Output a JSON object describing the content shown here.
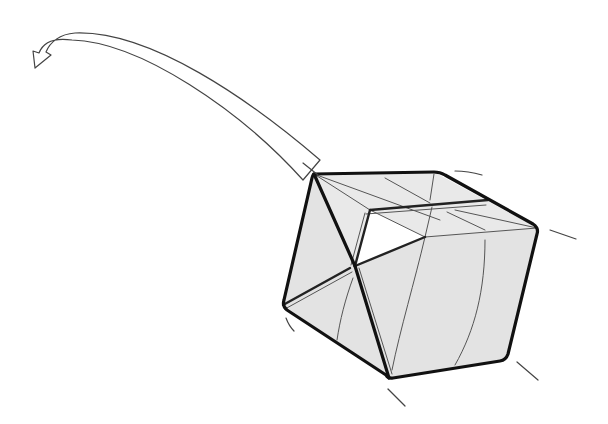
{
  "figure": {
    "paper_color": "#e3e3e3",
    "line_color": "#111111",
    "background": "#ffffff"
  },
  "elements": {
    "motion_arrow": "curved hollow arrow pointing up-left",
    "motion_lines": 6,
    "cube_faces": 3
  }
}
